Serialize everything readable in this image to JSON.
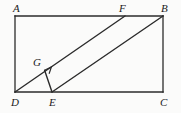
{
  "figure": {
    "kind": "geometry-diagram",
    "stroke_color": "#2b2b2b",
    "background_color": "#fbfbfa",
    "label_color": "#1a1a1a",
    "canvas": {
      "width": 181,
      "height": 113
    },
    "points": {
      "A": {
        "x": 15,
        "y": 16,
        "label": "A",
        "label_x": 13,
        "label_y": 3
      },
      "B": {
        "x": 163,
        "y": 16,
        "label": "B",
        "label_x": 161,
        "label_y": 3
      },
      "C": {
        "x": 163,
        "y": 92,
        "label": "C",
        "label_x": 160,
        "label_y": 97
      },
      "D": {
        "x": 15,
        "y": 92,
        "label": "D",
        "label_x": 11,
        "label_y": 97
      },
      "E": {
        "x": 52,
        "y": 92,
        "label": "E",
        "label_x": 49,
        "label_y": 97
      },
      "F": {
        "x": 125,
        "y": 16,
        "label": "F",
        "label_x": 119,
        "label_y": 3
      },
      "G": {
        "x": 44.6,
        "y": 70.3,
        "label": "G",
        "label_x": 33,
        "label_y": 57
      }
    },
    "segments": [
      {
        "name": "side-AB",
        "from": "A",
        "to": "B"
      },
      {
        "name": "side-BC",
        "from": "B",
        "to": "C"
      },
      {
        "name": "side-CD",
        "from": "C",
        "to": "D"
      },
      {
        "name": "side-DA",
        "from": "D",
        "to": "A"
      },
      {
        "name": "diagonal-DF",
        "from": "D",
        "to": "F"
      },
      {
        "name": "diagonal-EB",
        "from": "E",
        "to": "B"
      },
      {
        "name": "perpendicular-EG",
        "from": "E",
        "to": "G"
      }
    ],
    "right_angle_marker": {
      "name": "right-angle-at-G",
      "at": "G",
      "size": 7
    }
  }
}
